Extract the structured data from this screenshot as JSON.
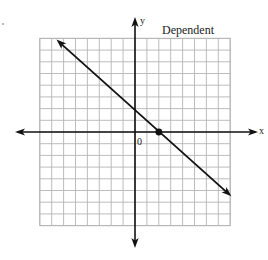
{
  "chart_data": {
    "type": "line",
    "title": "Dependent",
    "xlabel": "x",
    "ylabel": "y",
    "origin_label": "0",
    "xlim": [
      -8,
      8
    ],
    "ylim": [
      -8,
      8
    ],
    "grid": true,
    "grid_step": 1,
    "series": [
      {
        "name": "line",
        "equation": "y = -x + 2 (approx.)",
        "points": [
          [
            -6.6,
            7.9
          ],
          [
            8.1,
            -5.5
          ]
        ],
        "arrows": "both"
      }
    ],
    "highlighted_points": [
      {
        "label": "x-intercept",
        "x": 2,
        "y": 0
      }
    ],
    "colors": {
      "grid": "#b5b5b5",
      "axis": "#111111",
      "line": "#111111"
    }
  }
}
